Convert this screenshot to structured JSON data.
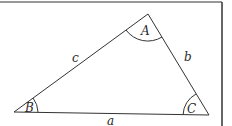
{
  "diagram": {
    "type": "triangle",
    "vertices": [
      {
        "id": "A",
        "label": "A",
        "x": 148,
        "y": 14
      },
      {
        "id": "B",
        "label": "B",
        "x": 14,
        "y": 112
      },
      {
        "id": "C",
        "label": "C",
        "x": 209,
        "y": 115
      }
    ],
    "sides": [
      {
        "id": "a",
        "label": "a",
        "between": [
          "B",
          "C"
        ]
      },
      {
        "id": "b",
        "label": "b",
        "between": [
          "A",
          "C"
        ]
      },
      {
        "id": "c",
        "label": "c",
        "between": [
          "A",
          "B"
        ]
      }
    ],
    "colors": {
      "line": "#333333",
      "frame": "#333333",
      "background": "#ffffff"
    }
  }
}
